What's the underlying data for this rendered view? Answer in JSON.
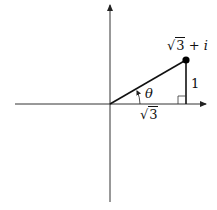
{
  "diagram": {
    "type": "complex-plane-triangle",
    "colors": {
      "stroke": "#111111",
      "axis": "#333333",
      "background": "#ffffff"
    },
    "point": {
      "label_radicand": "3",
      "label_radical": "√",
      "label_rest": " + ",
      "label_imag": "i",
      "full_label": "√3 + i"
    },
    "labels": {
      "adjacent_radical": "√",
      "adjacent_radicand": "3",
      "adjacent_full": "√3",
      "opposite": "1",
      "angle": "θ"
    }
  }
}
